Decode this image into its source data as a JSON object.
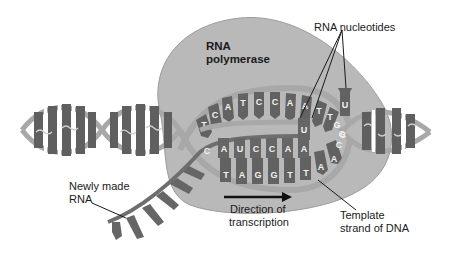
{
  "diagram": {
    "type": "transcription-illustration",
    "colors": {
      "background": "#ffffff",
      "polymerase": "#b7b7b7",
      "polymerase_edge": "#9a9a9a",
      "strand_backbone": "#a9a9a9",
      "base_dark": "#5e5e5e",
      "rna_strand": "#6b6b6b",
      "text": "#1a1a1a"
    },
    "labels": {
      "enzyme_line1": "RNA",
      "enzyme_line2": "polymerase",
      "nucleotides": "RNA nucleotides",
      "new_rna_line1": "Newly made",
      "new_rna_line2": "RNA",
      "direction_line1": "Direction of",
      "direction_line2": "transcription",
      "template_line1": "Template",
      "template_line2": "strand of DNA"
    },
    "sequences": {
      "coding_strand_top": [
        "T",
        "C",
        "A",
        "T",
        "C",
        "C",
        "A",
        "A",
        "T",
        "T",
        "G",
        "G"
      ],
      "rna_being_made": [
        "C",
        "A",
        "U",
        "C",
        "C",
        "A",
        "A",
        "U"
      ],
      "template_strand": [
        "T",
        "A",
        "G",
        "G",
        "T",
        "T",
        "A",
        "A",
        "C",
        "C"
      ],
      "free_nucleotides": [
        "U",
        "U"
      ]
    }
  }
}
